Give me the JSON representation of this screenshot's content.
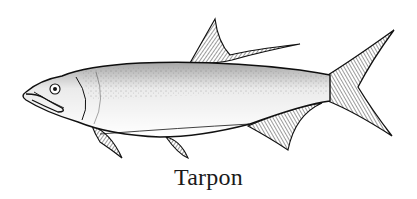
{
  "figure": {
    "caption": "Tarpon",
    "colors": {
      "ink": "#111111",
      "background": "#ffffff"
    }
  }
}
